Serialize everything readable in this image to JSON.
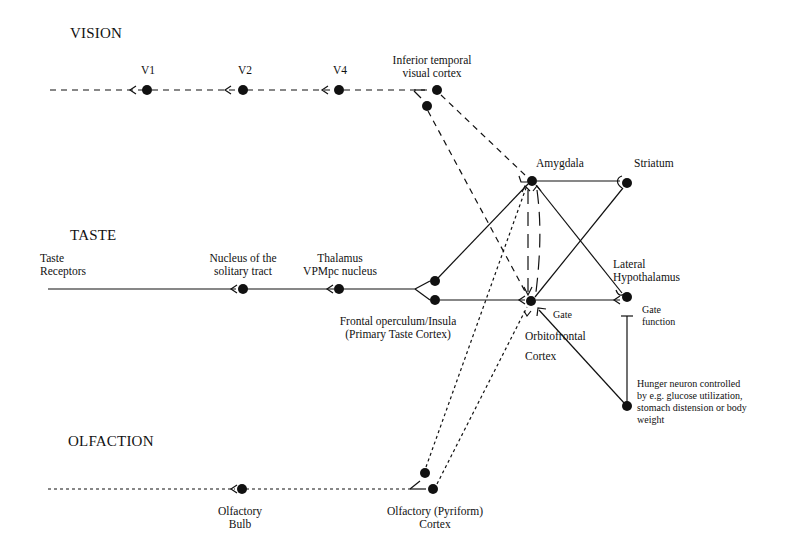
{
  "sections": {
    "vision": "VISION",
    "taste": "TASTE",
    "olfaction": "OLFACTION"
  },
  "nodes": {
    "v1": {
      "label": "V1"
    },
    "v2": {
      "label": "V2"
    },
    "v4": {
      "label": "V4"
    },
    "it": {
      "line1": "Inferior temporal",
      "line2": "visual cortex"
    },
    "amygdala": {
      "label": "Amygdala"
    },
    "striatum": {
      "label": "Striatum"
    },
    "taste_receptors": {
      "line1": "Taste",
      "line2": "Receptors"
    },
    "nts": {
      "line1": "Nucleus of the",
      "line2": "solitary tract"
    },
    "thalamus": {
      "line1": "Thalamus",
      "line2": "VPMpc nucleus"
    },
    "frontal_operculum": {
      "line1": "Frontal operculum/Insula",
      "line2": "(Primary Taste Cortex)"
    },
    "ofc": {
      "line1": "Orbitofrontal",
      "line2": "Cortex"
    },
    "gate": {
      "label": "Gate"
    },
    "lateral_hypothalamus": {
      "line1": "Lateral",
      "line2": "Hypothalamus"
    },
    "gate_function": {
      "line1": "Gate",
      "line2": "function"
    },
    "hunger_neuron": {
      "line1": "Hunger neuron controlled",
      "line2": "by e.g. glucose utilization,",
      "line3": "stomach distension or body",
      "line4": "weight"
    },
    "olfactory_bulb": {
      "line1": "Olfactory",
      "line2": "Bulb"
    },
    "pyriform": {
      "line1": "Olfactory (Pyriform)",
      "line2": "Cortex"
    }
  },
  "colors": {
    "ink": "#111111",
    "background": "#ffffff"
  }
}
